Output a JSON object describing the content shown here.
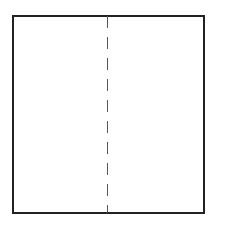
{
  "diagram": {
    "shape": "rectangle",
    "divider": {
      "style": "dashed",
      "orientation": "vertical",
      "position": "center"
    },
    "colors": {
      "border": "#222222",
      "divider": "#555555",
      "background": "#ffffff"
    }
  }
}
